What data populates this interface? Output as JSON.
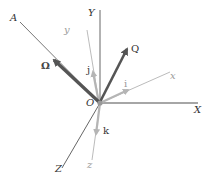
{
  "diagram": {
    "origin_label": "O",
    "fixed_axes": {
      "X": "X",
      "Y": "Y",
      "Z": "Z"
    },
    "rotating_axes": {
      "x": "x",
      "y": "y",
      "z": "z"
    },
    "unit_vectors": {
      "i": "i",
      "j": "j",
      "k": "k"
    },
    "vectors": {
      "omega": "Ω",
      "Q": "Q"
    },
    "line_A": "A",
    "colors": {
      "fixed_axis": "#555555",
      "rotating_axis": "#aaaaaa",
      "unit_vector": "#b5b5b5",
      "main_vector": "#555555",
      "origin": "#999999"
    }
  }
}
